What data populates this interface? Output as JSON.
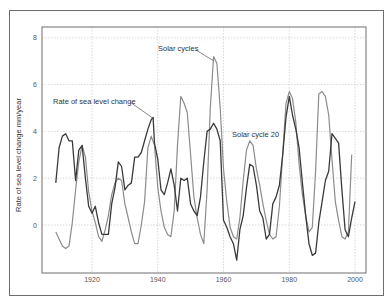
{
  "chart_data": {
    "type": "line",
    "title": "",
    "xlabel": "",
    "ylabel": "Rate of sea level change mm/year",
    "xlim": [
      1905,
      2003
    ],
    "ylim": [
      -2.1,
      8.5
    ],
    "grid": true,
    "x_ticks": [
      1920,
      1940,
      1960,
      1980,
      2000
    ],
    "x_tick_labels": [
      "1920",
      "1940",
      "1960",
      "1980",
      "2000"
    ],
    "y_ticks": [
      0,
      2,
      4,
      6,
      8
    ],
    "y_tick_labels": [
      "0",
      "2",
      "4",
      "6",
      "8"
    ],
    "series": [
      {
        "name": "Solar cycles",
        "color": "#8c8c8c",
        "x": [
          1909,
          1910,
          1911,
          1912,
          1913,
          1914,
          1915,
          1916,
          1917,
          1918,
          1919,
          1920,
          1921,
          1922,
          1923,
          1924,
          1925,
          1926,
          1927,
          1928,
          1929,
          1930,
          1931,
          1932,
          1933,
          1934,
          1935,
          1936,
          1937,
          1938,
          1939,
          1940,
          1941,
          1942,
          1943,
          1944,
          1945,
          1946,
          1947,
          1948,
          1949,
          1950,
          1951,
          1952,
          1953,
          1954,
          1955,
          1956,
          1957,
          1958,
          1959,
          1960,
          1961,
          1962,
          1963,
          1964,
          1965,
          1966,
          1967,
          1968,
          1969,
          1970,
          1971,
          1972,
          1973,
          1974,
          1975,
          1976,
          1977,
          1978,
          1979,
          1980,
          1981,
          1982,
          1983,
          1984,
          1985,
          1986,
          1987,
          1988,
          1989,
          1990,
          1991,
          1992,
          1993,
          1994,
          1995,
          1996,
          1997,
          1998,
          1999
        ],
        "values": [
          -0.3,
          -0.6,
          -0.9,
          -1.0,
          -0.9,
          0.1,
          1.5,
          2.7,
          3.4,
          2.9,
          1.4,
          0.6,
          0.1,
          -0.5,
          -0.7,
          -0.2,
          0.4,
          1.3,
          1.8,
          2.0,
          1.9,
          0.9,
          0.3,
          -0.3,
          -0.8,
          -0.8,
          0.0,
          1.0,
          3.3,
          3.8,
          3.4,
          1.6,
          0.6,
          -0.1,
          -0.4,
          -0.5,
          0.6,
          3.4,
          5.5,
          5.2,
          4.8,
          3.0,
          1.2,
          0.3,
          -0.4,
          -0.8,
          1.5,
          5.0,
          7.2,
          6.9,
          5.0,
          2.4,
          1.0,
          -0.1,
          -0.5,
          -0.6,
          0.3,
          1.9,
          3.2,
          3.6,
          3.4,
          2.4,
          1.7,
          0.9,
          0.2,
          -0.4,
          -0.6,
          -0.5,
          0.8,
          3.0,
          5.2,
          5.7,
          5.4,
          4.4,
          2.6,
          1.3,
          0.4,
          -0.3,
          -0.1,
          2.3,
          5.6,
          5.7,
          5.5,
          4.7,
          2.8,
          1.0,
          0.2,
          -0.5,
          -0.6,
          -0.3,
          3.0
        ]
      },
      {
        "name": "Rate of sea level change",
        "color": "#3a3a3a",
        "x": [
          1909,
          1910,
          1911,
          1912,
          1913,
          1914,
          1915,
          1916,
          1917,
          1918,
          1919,
          1920,
          1921,
          1922,
          1923,
          1924,
          1925,
          1926,
          1927,
          1928,
          1929,
          1930,
          1931,
          1932,
          1933,
          1934,
          1935,
          1936,
          1937,
          1938,
          1938.6,
          1939,
          1940,
          1941,
          1942,
          1943,
          1944,
          1945,
          1946,
          1947,
          1948,
          1949,
          1950,
          1951,
          1952,
          1953,
          1954,
          1955,
          1956,
          1957,
          1958,
          1959,
          1960,
          1961,
          1962,
          1963,
          1964,
          1965,
          1966,
          1967,
          1968,
          1969,
          1970,
          1971,
          1972,
          1973,
          1974,
          1975,
          1976,
          1977,
          1978,
          1979,
          1980,
          1981,
          1982,
          1983,
          1984,
          1985,
          1986,
          1987,
          1988,
          1989,
          1990,
          1991,
          1992,
          1993,
          1994,
          1995,
          1996,
          1997,
          1998,
          1999,
          2000
        ],
        "values": [
          1.8,
          3.3,
          3.8,
          3.9,
          3.6,
          3.6,
          1.9,
          3.2,
          3.4,
          2.0,
          0.8,
          0.5,
          0.8,
          0.1,
          -0.4,
          -0.4,
          -0.4,
          0.9,
          1.6,
          2.7,
          2.5,
          1.5,
          1.7,
          1.8,
          2.9,
          2.9,
          3.1,
          3.6,
          4.1,
          4.5,
          4.6,
          3.5,
          2.8,
          1.5,
          1.3,
          1.8,
          2.4,
          1.7,
          0.6,
          2.0,
          1.9,
          2.0,
          0.9,
          0.6,
          0.4,
          1.2,
          2.7,
          4.0,
          4.1,
          4.35,
          4.1,
          3.6,
          0.2,
          -0.1,
          -0.5,
          -0.8,
          -1.5,
          -0.2,
          0.4,
          1.6,
          2.6,
          2.5,
          1.7,
          0.6,
          0.3,
          -0.6,
          -0.4,
          0.9,
          1.2,
          1.7,
          3.0,
          4.6,
          5.5,
          4.7,
          4.1,
          3.3,
          1.8,
          0.4,
          -0.8,
          -1.3,
          -1.2,
          0.1,
          1.0,
          1.9,
          2.3,
          3.9,
          3.7,
          3.5,
          1.5,
          -0.2,
          -0.5,
          0.3,
          1.0
        ]
      }
    ],
    "annotations": [
      {
        "text": "Solar cycles",
        "points_to": {
          "x": 1957.3,
          "y": 7.1
        }
      },
      {
        "text": "Rate of sea level change",
        "points_to": {
          "x": 1938.6,
          "y": 4.6
        }
      },
      {
        "text": "Solar cycle 20",
        "points_to": null
      }
    ],
    "legend": "none"
  }
}
